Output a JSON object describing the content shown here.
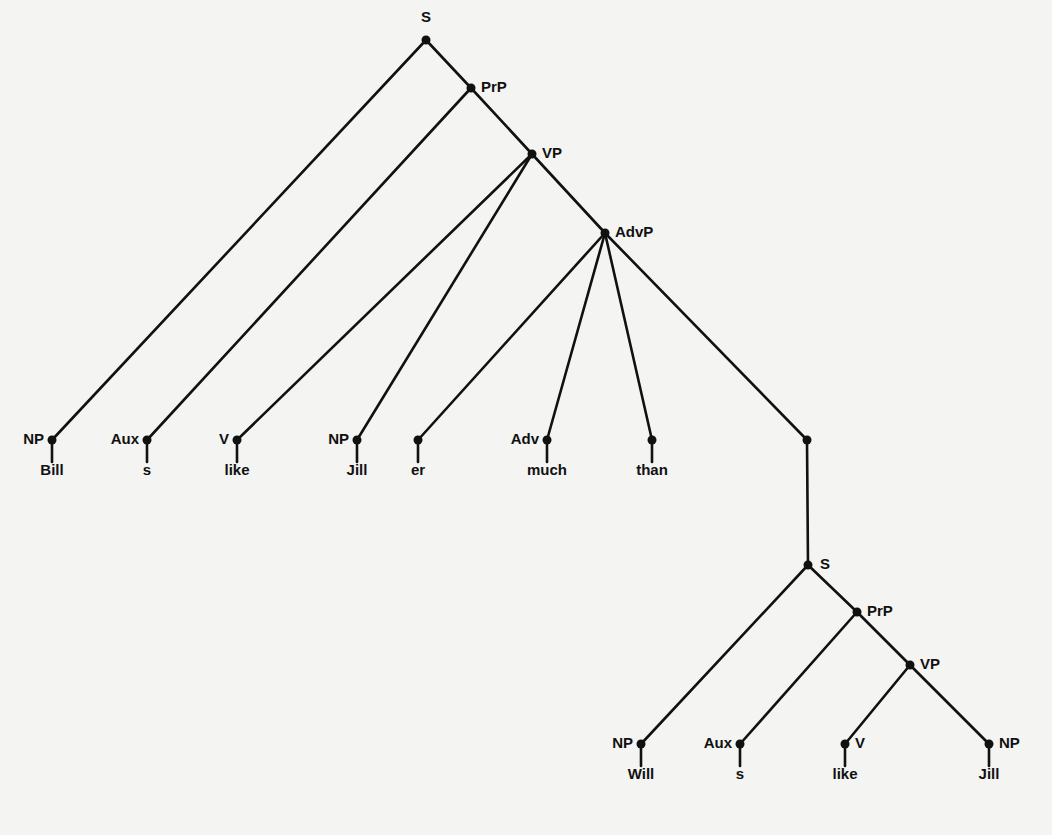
{
  "diagram": {
    "type": "syntax-tree",
    "sentence": "Bill s like Jill er much than Will s like Jill",
    "nodes": [
      {
        "id": "S",
        "label": "S",
        "x": 426,
        "y": 40,
        "lx": 426,
        "ly": 22,
        "anchor": "middle"
      },
      {
        "id": "PrP",
        "label": "PrP",
        "x": 471,
        "y": 88,
        "lx": 481,
        "ly": 92,
        "anchor": "start"
      },
      {
        "id": "VP",
        "label": "VP",
        "x": 532,
        "y": 154,
        "lx": 542,
        "ly": 158,
        "anchor": "start"
      },
      {
        "id": "AdvP",
        "label": "AdvP",
        "x": 605,
        "y": 233,
        "lx": 615,
        "ly": 237,
        "anchor": "start"
      },
      {
        "id": "NP1",
        "label": "NP",
        "x": 52,
        "y": 440,
        "lx": 44,
        "ly": 444,
        "anchor": "end"
      },
      {
        "id": "Aux1",
        "label": "Aux",
        "x": 147,
        "y": 440,
        "lx": 139,
        "ly": 444,
        "anchor": "end"
      },
      {
        "id": "V1",
        "label": "V",
        "x": 237,
        "y": 440,
        "lx": 229,
        "ly": 444,
        "anchor": "end"
      },
      {
        "id": "NP2",
        "label": "NP",
        "x": 357,
        "y": 440,
        "lx": 349,
        "ly": 444,
        "anchor": "end"
      },
      {
        "id": "er",
        "label": "",
        "x": 418,
        "y": 440,
        "lx": 0,
        "ly": 0,
        "anchor": "end"
      },
      {
        "id": "Adv",
        "label": "Adv",
        "x": 547,
        "y": 440,
        "lx": 539,
        "ly": 444,
        "anchor": "end"
      },
      {
        "id": "than",
        "label": "",
        "x": 652,
        "y": 440,
        "lx": 0,
        "ly": 0,
        "anchor": "end"
      },
      {
        "id": "Sbar",
        "label": "",
        "x": 807,
        "y": 440,
        "lx": 0,
        "ly": 0,
        "anchor": "end"
      },
      {
        "id": "S2",
        "label": "S",
        "x": 808,
        "y": 565,
        "lx": 820,
        "ly": 569,
        "anchor": "start"
      },
      {
        "id": "PrP2",
        "label": "PrP",
        "x": 857,
        "y": 612,
        "lx": 867,
        "ly": 616,
        "anchor": "start"
      },
      {
        "id": "VP2",
        "label": "VP",
        "x": 910,
        "y": 665,
        "lx": 920,
        "ly": 669,
        "anchor": "start"
      },
      {
        "id": "NP3",
        "label": "NP",
        "x": 641,
        "y": 744,
        "lx": 633,
        "ly": 748,
        "anchor": "end"
      },
      {
        "id": "Aux2",
        "label": "Aux",
        "x": 740,
        "y": 744,
        "lx": 732,
        "ly": 748,
        "anchor": "end"
      },
      {
        "id": "V2",
        "label": "V",
        "x": 845,
        "y": 744,
        "lx": 855,
        "ly": 748,
        "anchor": "start"
      },
      {
        "id": "NP4",
        "label": "NP",
        "x": 989,
        "y": 744,
        "lx": 999,
        "ly": 748,
        "anchor": "start"
      }
    ],
    "edges": [
      [
        "S",
        "NP1"
      ],
      [
        "S",
        "PrP"
      ],
      [
        "PrP",
        "Aux1"
      ],
      [
        "PrP",
        "VP"
      ],
      [
        "VP",
        "V1"
      ],
      [
        "VP",
        "NP2"
      ],
      [
        "VP",
        "AdvP"
      ],
      [
        "AdvP",
        "er"
      ],
      [
        "AdvP",
        "Adv"
      ],
      [
        "AdvP",
        "than"
      ],
      [
        "AdvP",
        "Sbar"
      ],
      [
        "Sbar",
        "S2"
      ],
      [
        "S2",
        "NP3"
      ],
      [
        "S2",
        "PrP2"
      ],
      [
        "PrP2",
        "Aux2"
      ],
      [
        "PrP2",
        "VP2"
      ],
      [
        "VP2",
        "V2"
      ],
      [
        "VP2",
        "NP4"
      ]
    ],
    "leaves": [
      {
        "node": "NP1",
        "word": "Bill",
        "x": 52,
        "stem_to": 462,
        "wy": 475
      },
      {
        "node": "Aux1",
        "word": "s",
        "x": 147,
        "stem_to": 462,
        "wy": 475
      },
      {
        "node": "V1",
        "word": "like",
        "x": 237,
        "stem_to": 462,
        "wy": 475
      },
      {
        "node": "NP2",
        "word": "Jill",
        "x": 357,
        "stem_to": 462,
        "wy": 475
      },
      {
        "node": "er",
        "word": "er",
        "x": 418,
        "stem_to": 462,
        "wy": 475
      },
      {
        "node": "Adv",
        "word": "much",
        "x": 547,
        "stem_to": 462,
        "wy": 475
      },
      {
        "node": "than",
        "word": "than",
        "x": 652,
        "stem_to": 462,
        "wy": 475
      },
      {
        "node": "NP3",
        "word": "Will",
        "x": 641,
        "stem_to": 766,
        "wy": 779
      },
      {
        "node": "Aux2",
        "word": "s",
        "x": 740,
        "stem_to": 766,
        "wy": 779
      },
      {
        "node": "V2",
        "word": "like",
        "x": 845,
        "stem_to": 766,
        "wy": 779
      },
      {
        "node": "NP4",
        "word": "Jill",
        "x": 989,
        "stem_to": 766,
        "wy": 779
      }
    ]
  }
}
